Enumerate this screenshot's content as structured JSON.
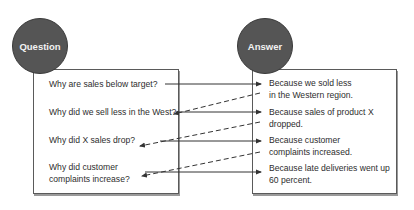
{
  "diagram": {
    "question_header": "Question",
    "answer_header": "Answer",
    "questions": [
      {
        "line1": "Why are sales below target?",
        "line2": ""
      },
      {
        "line1": "Why did we sell less in the West?",
        "line2": ""
      },
      {
        "line1": "Why did X sales drop?",
        "line2": ""
      },
      {
        "line1": "Why did customer",
        "line2": "complaints increase?"
      }
    ],
    "answers": [
      {
        "line1": "Because we sold less",
        "line2": "in the Western region."
      },
      {
        "line1": "Because sales of product X",
        "line2": "dropped."
      },
      {
        "line1": "Because customer",
        "line2": "complaints increased."
      },
      {
        "line1": "Because late deliveries went up",
        "line2": "60 percent."
      }
    ],
    "colors": {
      "circle_fill": "#555555",
      "circle_text": "#f2f2f2",
      "box_border": "#5a5a5a",
      "arrow": "#333333"
    }
  }
}
